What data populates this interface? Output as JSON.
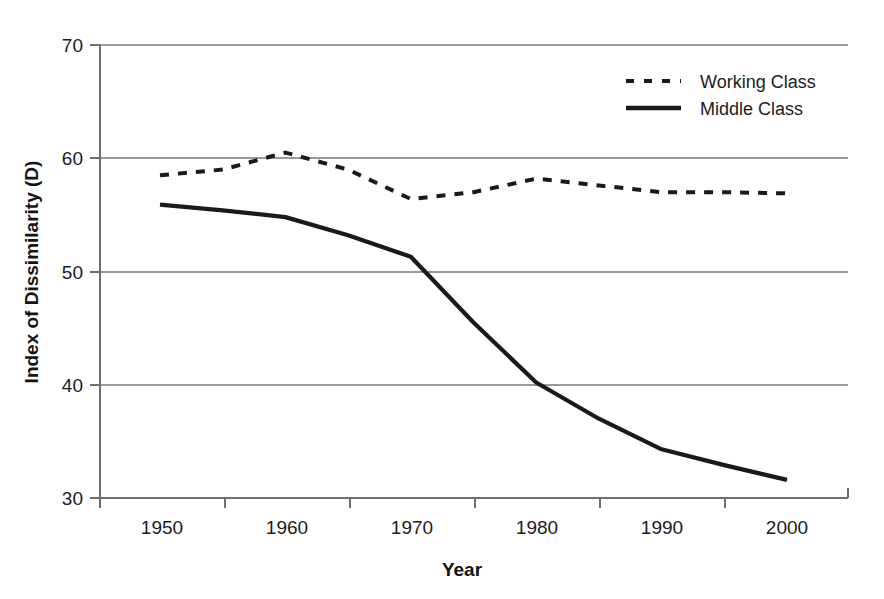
{
  "chart_data": {
    "type": "line",
    "title": "",
    "xlabel": "Year",
    "ylabel": "Index of Dissimilarity (D)",
    "x": [
      1950,
      1955,
      1960,
      1965,
      1970,
      1975,
      1980,
      1985,
      1990,
      1995,
      2000
    ],
    "categories": [
      "1950",
      "1955",
      "1960",
      "1965",
      "1970",
      "1975",
      "1980",
      "1985",
      "1990",
      "1995",
      "2000"
    ],
    "series": [
      {
        "name": "Working Class",
        "style": "dashed",
        "values": [
          58.5,
          59.0,
          60.5,
          59.0,
          56.4,
          57.0,
          58.2,
          57.6,
          57.0,
          57.0,
          56.9
        ]
      },
      {
        "name": "Middle Class",
        "style": "solid",
        "values": [
          55.9,
          55.4,
          54.8,
          53.2,
          51.3,
          45.5,
          40.2,
          37.0,
          34.3,
          32.9,
          31.6
        ]
      }
    ],
    "xlim": [
      1950,
      2000
    ],
    "ylim": [
      30,
      70
    ],
    "xticks": [
      1950,
      1960,
      1970,
      1980,
      1990,
      2000
    ],
    "xtick_labels": [
      "1950",
      "1960",
      "1970",
      "1980",
      "1990",
      "2000"
    ],
    "yticks": [
      30,
      40,
      50,
      60,
      70
    ],
    "ytick_labels": [
      "30",
      "40",
      "50",
      "60",
      "70"
    ],
    "grid": "horizontal",
    "legend_position": "top-right",
    "colors": {
      "series_line": "#1a1a1a",
      "gridline": "#9a9a9a",
      "axis": "#6e6e6e",
      "background": "#ffffff",
      "text": "#1c1c1c"
    }
  },
  "axes": {
    "y_title": "Index of Dissimilarity (D)",
    "x_title": "Year",
    "y_ticks": [
      "70",
      "60",
      "50",
      "40",
      "30"
    ],
    "x_ticks": [
      "1950",
      "1960",
      "1970",
      "1980",
      "1990",
      "2000"
    ]
  },
  "legend": {
    "items": [
      {
        "label": "Working Class",
        "style": "dashed"
      },
      {
        "label": "Middle Class",
        "style": "solid"
      }
    ]
  }
}
